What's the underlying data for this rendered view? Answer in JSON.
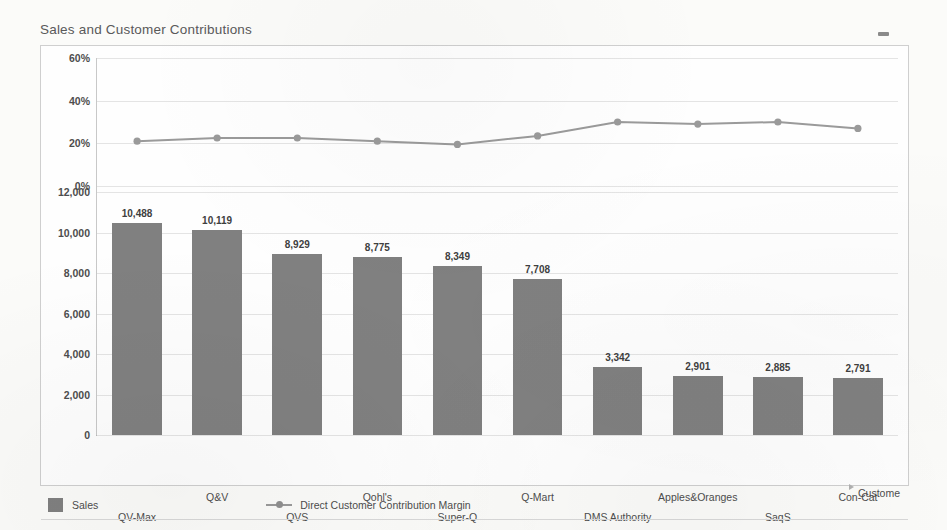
{
  "chart_title": "Sales and Customer Contributions",
  "window": {
    "minimize_icon": "minimize-dash-icon"
  },
  "legend": {
    "series_bar_label": "Sales",
    "series_line_label": "Direct Customer Contribution Margin",
    "bar_swatch_color": "#808080",
    "line_swatch_color": "#9a9a9a"
  },
  "axes": {
    "x_title": "Custome",
    "pct_ticks": [
      "60%",
      "40%",
      "20%",
      "0%"
    ],
    "value_ticks": [
      "12,000",
      "10,000",
      "8,000",
      "6,000",
      "4,000",
      "2,000",
      "0"
    ]
  },
  "chart_data": {
    "type": "bar",
    "title": "Sales and Customer Contributions",
    "xlabel": "Custome",
    "ylabel": "",
    "grid": true,
    "legend_position": "bottom",
    "categories": [
      "QV-Max",
      "Q&V",
      "QVS",
      "Qohl's",
      "Super-Q",
      "Q-Mart",
      "DMS Authority",
      "Apples&Oranges",
      "SaqS",
      "Con-Cat"
    ],
    "series": [
      {
        "name": "Sales",
        "type": "bar",
        "axis": "left-lower",
        "color": "#808080",
        "ylim": [
          0,
          12000
        ],
        "values": [
          10488,
          10119,
          8929,
          8775,
          8349,
          7708,
          3342,
          2901,
          2885,
          2791
        ],
        "data_labels": [
          "10,488",
          "10,119",
          "8,929",
          "8,775",
          "8,349",
          "7,708",
          "3,342",
          "2,901",
          "2,885",
          "2,791"
        ]
      },
      {
        "name": "Direct Customer Contribution Margin",
        "type": "line",
        "axis": "left-upper",
        "color": "#9a9a9a",
        "ylim": [
          0,
          60
        ],
        "unit": "%",
        "values": [
          21,
          22.5,
          22.5,
          21,
          19.5,
          23.5,
          30,
          29,
          30,
          27
        ]
      }
    ]
  }
}
